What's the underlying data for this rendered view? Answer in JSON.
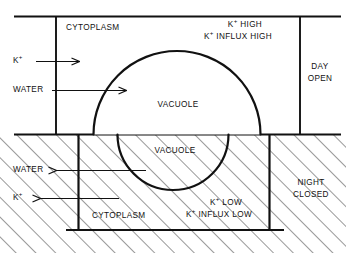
{
  "figure": {
    "type": "cell-vacuole-diagram",
    "line_color": "#111111",
    "background": "#ffffff",
    "hatch_color": "#555555"
  },
  "panels": {
    "day": {
      "state_line1": "DAY",
      "state_line2": "OPEN",
      "cytoplasm_label": "CYTOPLASM",
      "vacuole_label": "VACUOLE",
      "note_line1_ion": "K",
      "note_line1_charge": "+",
      "note_line1_text": "HIGH",
      "note_line2_ion": "K",
      "note_line2_charge": "+",
      "note_line2_text": "INFLUX HIGH",
      "arrows": [
        {
          "label_ion": "K",
          "label_charge": "+",
          "label_text": "",
          "direction": "right"
        },
        {
          "label_ion": "",
          "label_charge": "",
          "label_text": "WATER",
          "direction": "right"
        }
      ]
    },
    "night": {
      "state_line1": "NIGHT",
      "state_line2": "CLOSED",
      "cytoplasm_label": "CYTOPLASM",
      "vacuole_label": "VACUOLE",
      "note_line1_ion": "K",
      "note_line1_charge": "+",
      "note_line1_text": "LOW",
      "note_line2_ion": "K",
      "note_line2_charge": "+",
      "note_line2_text": "INFLUX LOW",
      "arrows": [
        {
          "label_ion": "",
          "label_charge": "",
          "label_text": "WATER",
          "direction": "left"
        },
        {
          "label_ion": "K",
          "label_charge": "+",
          "label_text": "",
          "direction": "left"
        }
      ]
    }
  },
  "text": {
    "k_ion": "K",
    "plus": "+",
    "water": "WATER",
    "cytoplasm": "CYTOPLASM",
    "vacuole": "VACUOLE",
    "k_high": "HIGH",
    "k_influx_high": "INFLUX HIGH",
    "k_low": "LOW",
    "k_influx_low": "INFLUX LOW",
    "day": "DAY",
    "open": "OPEN",
    "night": "NIGHT",
    "closed": "CLOSED"
  }
}
